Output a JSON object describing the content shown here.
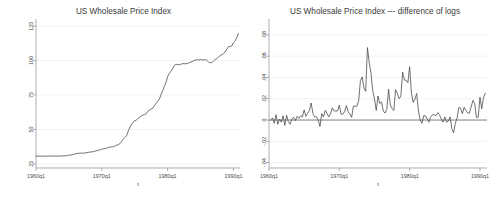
{
  "figure": {
    "background_color": "#ffffff",
    "line_color": "#4d4d4d",
    "axis_color": "#8d8d8d",
    "grid_color": "#e9e9ef",
    "panel_count": 2
  },
  "panels": [
    {
      "id": "wpi-level",
      "title": "US Wholesale Price Index",
      "xlabel": "t",
      "ylabel": "",
      "xticklabels": [
        "1960q1",
        "1970q1",
        "1980q1",
        "1990q1"
      ],
      "yticklabels": [
        "25",
        "50",
        "75",
        "100",
        "125"
      ]
    },
    {
      "id": "wpi-dlog",
      "title": "US Wholesale Price Index --- difference of logs",
      "xlabel": "t",
      "ylabel": "",
      "xticklabels": [
        "1960q1",
        "1970q1",
        "1980q1",
        "1990q1"
      ],
      "yticklabels": [
        "-.04",
        "-.02",
        "0",
        ".02",
        ".04",
        ".06",
        ".08"
      ]
    }
  ],
  "chart_data": [
    {
      "type": "line",
      "id": "wpi-level",
      "title": "US Wholesale Price Index",
      "xlabel": "t",
      "ylabel": "",
      "grid": true,
      "legend": "none",
      "xlim": [
        1960.0,
        1991.0
      ],
      "ylim": [
        22.0,
        128.0
      ],
      "xticks": [
        1960,
        1970,
        1980,
        1990
      ],
      "xticklabels": [
        "1960q1",
        "1970q1",
        "1980q1",
        "1990q1"
      ],
      "yticks": [
        25,
        50,
        75,
        100,
        125
      ],
      "yticklabels": [
        "25",
        "50",
        "75",
        "100",
        "125"
      ],
      "x": [
        1960.0,
        1960.25,
        1960.5,
        1960.75,
        1961.0,
        1961.25,
        1961.5,
        1961.75,
        1962.0,
        1962.25,
        1962.5,
        1962.75,
        1963.0,
        1963.25,
        1963.5,
        1963.75,
        1964.0,
        1964.25,
        1964.5,
        1964.75,
        1965.0,
        1965.25,
        1965.5,
        1965.75,
        1966.0,
        1966.25,
        1966.5,
        1966.75,
        1967.0,
        1967.25,
        1967.5,
        1967.75,
        1968.0,
        1968.25,
        1968.5,
        1968.75,
        1969.0,
        1969.25,
        1969.5,
        1969.75,
        1970.0,
        1970.25,
        1970.5,
        1970.75,
        1971.0,
        1971.25,
        1971.5,
        1971.75,
        1972.0,
        1972.25,
        1972.5,
        1972.75,
        1973.0,
        1973.25,
        1973.5,
        1973.75,
        1974.0,
        1974.25,
        1974.5,
        1974.75,
        1975.0,
        1975.25,
        1975.5,
        1975.75,
        1976.0,
        1976.25,
        1976.5,
        1976.75,
        1977.0,
        1977.25,
        1977.5,
        1977.75,
        1978.0,
        1978.25,
        1978.5,
        1978.75,
        1979.0,
        1979.25,
        1979.5,
        1979.75,
        1980.0,
        1980.25,
        1980.5,
        1980.75,
        1981.0,
        1981.25,
        1981.5,
        1981.75,
        1982.0,
        1982.25,
        1982.5,
        1982.75,
        1983.0,
        1983.25,
        1983.5,
        1983.75,
        1984.0,
        1984.25,
        1984.5,
        1984.75,
        1985.0,
        1985.25,
        1985.5,
        1985.75,
        1986.0,
        1986.25,
        1986.5,
        1986.75,
        1987.0,
        1987.25,
        1987.5,
        1987.75,
        1988.0,
        1988.25,
        1988.5,
        1988.75,
        1989.0,
        1989.25,
        1989.5,
        1989.75,
        1990.0,
        1990.25,
        1990.5,
        1990.75
      ],
      "y": [
        30.6,
        30.6,
        30.6,
        30.6,
        30.7,
        30.6,
        30.6,
        30.6,
        30.7,
        30.6,
        30.7,
        30.7,
        30.6,
        30.6,
        30.7,
        30.7,
        30.8,
        30.8,
        30.9,
        31.0,
        31.3,
        31.4,
        31.6,
        31.9,
        32.4,
        32.6,
        32.7,
        32.8,
        32.8,
        32.8,
        33.0,
        33.1,
        33.4,
        33.6,
        33.7,
        33.9,
        34.3,
        34.6,
        34.9,
        35.2,
        35.7,
        35.9,
        36.1,
        36.4,
        36.9,
        37.2,
        37.4,
        37.5,
        38.0,
        38.5,
        39.0,
        39.7,
        41.2,
        42.9,
        44.2,
        45.4,
        48.6,
        51.3,
        53.6,
        55.1,
        56.2,
        56.7,
        58.0,
        58.9,
        59.9,
        60.4,
        60.8,
        61.4,
        63.2,
        64.1,
        64.8,
        65.4,
        67.3,
        69.0,
        70.4,
        72.0,
        75.3,
        78.2,
        81.2,
        84.1,
        88.4,
        90.7,
        92.2,
        94.0,
        96.4,
        97.2,
        97.2,
        96.9,
        97.3,
        97.7,
        97.8,
        97.6,
        97.9,
        98.4,
        98.9,
        99.3,
        100.0,
        100.5,
        100.6,
        100.4,
        100.7,
        100.5,
        100.4,
        100.7,
        99.9,
        98.7,
        98.4,
        98.6,
        99.8,
        100.9,
        101.5,
        102.7,
        103.6,
        104.3,
        105.0,
        106.3,
        108.3,
        110.0,
        110.3,
        110.6,
        113.0,
        114.2,
        116.6,
        119.6
      ]
    },
    {
      "type": "line",
      "id": "wpi-dlog",
      "title": "US Wholesale Price Index --- difference of logs",
      "xlabel": "t",
      "ylabel": "",
      "grid": true,
      "legend": "none",
      "xlim": [
        1960.0,
        1991.0
      ],
      "ylim": [
        -0.045,
        0.092
      ],
      "xticks": [
        1960,
        1970,
        1980,
        1990
      ],
      "xticklabels": [
        "1960q1",
        "1970q1",
        "1980q1",
        "1990q1"
      ],
      "yticks": [
        -0.04,
        -0.02,
        0,
        0.02,
        0.04,
        0.06,
        0.08
      ],
      "yticklabels": [
        "-.04",
        "-.02",
        "0",
        ".02",
        ".04",
        ".06",
        ".08"
      ],
      "zero_reference_line": 0,
      "x": [
        1960.25,
        1960.5,
        1960.75,
        1961.0,
        1961.25,
        1961.5,
        1961.75,
        1962.0,
        1962.25,
        1962.5,
        1962.75,
        1963.0,
        1963.25,
        1963.5,
        1963.75,
        1964.0,
        1964.25,
        1964.5,
        1964.75,
        1965.0,
        1965.25,
        1965.5,
        1965.75,
        1966.0,
        1966.25,
        1966.5,
        1966.75,
        1967.0,
        1967.25,
        1967.5,
        1967.75,
        1968.0,
        1968.25,
        1968.5,
        1968.75,
        1969.0,
        1969.25,
        1969.5,
        1969.75,
        1970.0,
        1970.25,
        1970.5,
        1970.75,
        1971.0,
        1971.25,
        1971.5,
        1971.75,
        1972.0,
        1972.25,
        1972.5,
        1972.75,
        1973.0,
        1973.25,
        1973.5,
        1973.75,
        1974.0,
        1974.25,
        1974.5,
        1974.75,
        1975.0,
        1975.25,
        1975.5,
        1975.75,
        1976.0,
        1976.25,
        1976.5,
        1976.75,
        1977.0,
        1977.25,
        1977.5,
        1977.75,
        1978.0,
        1978.25,
        1978.5,
        1978.75,
        1979.0,
        1979.25,
        1979.5,
        1979.75,
        1980.0,
        1980.25,
        1980.5,
        1980.75,
        1981.0,
        1981.25,
        1981.5,
        1981.75,
        1982.0,
        1982.25,
        1982.5,
        1982.75,
        1983.0,
        1983.25,
        1983.5,
        1983.75,
        1984.0,
        1984.25,
        1984.5,
        1984.75,
        1985.0,
        1985.25,
        1985.5,
        1985.75,
        1986.0,
        1986.25,
        1986.5,
        1986.75,
        1987.0,
        1987.25,
        1987.5,
        1987.75,
        1988.0,
        1988.25,
        1988.5,
        1988.75,
        1989.0,
        1989.25,
        1989.5,
        1989.75,
        1990.0,
        1990.25,
        1990.5,
        1990.75
      ],
      "y": [
        0.0,
        0.002,
        -0.003,
        0.005,
        -0.004,
        0.001,
        -0.002,
        0.004,
        -0.005,
        0.0045,
        -0.0015,
        -0.004,
        0.001,
        0.0025,
        -0.0005,
        0.0035,
        0.0015,
        0.004,
        0.003,
        0.0095,
        0.0035,
        0.0065,
        0.009,
        0.016,
        0.006,
        0.003,
        0.003,
        0.0,
        -0.006,
        0.006,
        0.003,
        0.009,
        0.006,
        0.003,
        0.006,
        0.0115,
        0.0085,
        0.0085,
        0.0085,
        0.014,
        0.0055,
        0.0055,
        0.008,
        0.0135,
        0.008,
        0.0055,
        0.0025,
        0.013,
        0.013,
        0.013,
        0.018,
        0.037,
        0.0405,
        0.03,
        0.027,
        0.068,
        0.054,
        0.044,
        0.0275,
        0.02,
        0.009,
        0.0225,
        0.0155,
        0.017,
        0.0085,
        0.0065,
        0.01,
        0.029,
        0.014,
        0.011,
        0.009,
        0.0285,
        0.025,
        0.02,
        0.0225,
        0.045,
        0.0375,
        0.0375,
        0.035,
        0.05,
        0.0255,
        0.0165,
        0.0195,
        0.025,
        0.0085,
        0.0,
        -0.003,
        0.004,
        0.004,
        0.001,
        -0.002,
        0.003,
        0.005,
        0.005,
        0.004,
        0.007,
        0.005,
        0.001,
        -0.002,
        0.003,
        -0.002,
        -0.001,
        0.003,
        -0.008,
        -0.012,
        -0.003,
        0.002,
        0.012,
        0.011,
        0.006,
        0.012,
        0.009,
        0.0065,
        0.0065,
        0.0125,
        0.0185,
        0.0155,
        0.0025,
        0.0025,
        0.0215,
        0.0105,
        0.021,
        0.025
      ]
    }
  ]
}
